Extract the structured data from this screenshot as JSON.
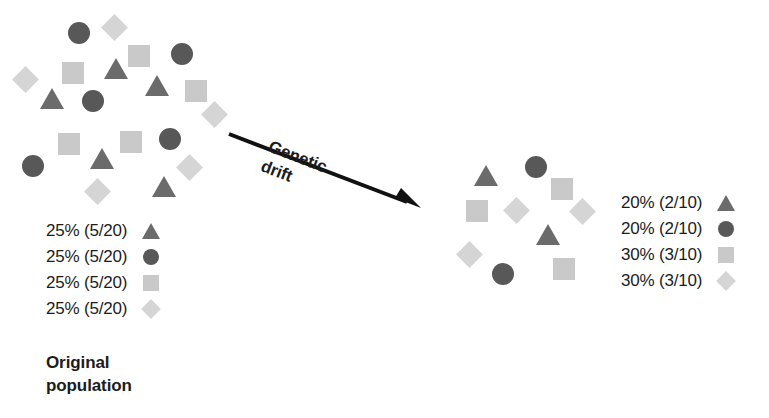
{
  "figure": {
    "type": "genetic-drift-diagram",
    "caption": {
      "line1": "Original",
      "line2": "population"
    },
    "arrow": {
      "label_line1": "Genetic",
      "label_line2": "drift"
    }
  },
  "colors": {
    "triangle": "#6b6b6b",
    "circle": "#585858",
    "square": "#c9c9c9",
    "diamond": "#d5d5d5",
    "text": "#1c1c1c",
    "background": "#ffffff"
  },
  "original_population": {
    "total": 20,
    "legend": [
      {
        "label": "25% (5/20)",
        "marker": "triangle-marker",
        "percent": 25,
        "count": 5,
        "of": 20
      },
      {
        "label": "25% (5/20)",
        "marker": "circle-marker",
        "percent": 25,
        "count": 5,
        "of": 20
      },
      {
        "label": "25% (5/20)",
        "marker": "square-marker",
        "percent": 25,
        "count": 5,
        "of": 20
      },
      {
        "label": "25% (5/20)",
        "marker": "diamond-marker",
        "percent": 25,
        "count": 5,
        "of": 20
      }
    ],
    "shapes": [
      {
        "kind": "circle",
        "x": 68,
        "y": 22
      },
      {
        "kind": "diamond",
        "x": 105,
        "y": 18
      },
      {
        "kind": "square",
        "x": 128,
        "y": 45
      },
      {
        "kind": "circle",
        "x": 171,
        "y": 43
      },
      {
        "kind": "square",
        "x": 62,
        "y": 62
      },
      {
        "kind": "triangle",
        "x": 104,
        "y": 58
      },
      {
        "kind": "triangle",
        "x": 145,
        "y": 75
      },
      {
        "kind": "diamond",
        "x": 16,
        "y": 70
      },
      {
        "kind": "square",
        "x": 185,
        "y": 80
      },
      {
        "kind": "triangle",
        "x": 40,
        "y": 88
      },
      {
        "kind": "circle",
        "x": 82,
        "y": 90
      },
      {
        "kind": "diamond",
        "x": 205,
        "y": 105
      },
      {
        "kind": "square",
        "x": 58,
        "y": 133
      },
      {
        "kind": "square",
        "x": 120,
        "y": 131
      },
      {
        "kind": "circle",
        "x": 159,
        "y": 128
      },
      {
        "kind": "circle",
        "x": 22,
        "y": 155
      },
      {
        "kind": "triangle",
        "x": 90,
        "y": 148
      },
      {
        "kind": "diamond",
        "x": 180,
        "y": 158
      },
      {
        "kind": "diamond",
        "x": 88,
        "y": 182
      },
      {
        "kind": "triangle",
        "x": 152,
        "y": 176
      }
    ]
  },
  "drifted_population": {
    "total": 10,
    "legend": [
      {
        "label": "20% (2/10)",
        "marker": "triangle-marker",
        "percent": 20,
        "count": 2,
        "of": 10
      },
      {
        "label": "20% (2/10)",
        "marker": "circle-marker",
        "percent": 20,
        "count": 2,
        "of": 10
      },
      {
        "label": "30% (3/10)",
        "marker": "square-marker",
        "percent": 30,
        "count": 3,
        "of": 10
      },
      {
        "label": "30% (3/10)",
        "marker": "diamond-marker",
        "percent": 30,
        "count": 3,
        "of": 10
      }
    ],
    "shapes": [
      {
        "kind": "triangle",
        "x": 474,
        "y": 165
      },
      {
        "kind": "circle",
        "x": 525,
        "y": 156
      },
      {
        "kind": "square",
        "x": 551,
        "y": 178
      },
      {
        "kind": "square",
        "x": 466,
        "y": 200
      },
      {
        "kind": "diamond",
        "x": 507,
        "y": 201
      },
      {
        "kind": "diamond",
        "x": 573,
        "y": 202
      },
      {
        "kind": "triangle",
        "x": 536,
        "y": 224
      },
      {
        "kind": "diamond",
        "x": 460,
        "y": 245
      },
      {
        "kind": "circle",
        "x": 492,
        "y": 263
      },
      {
        "kind": "square",
        "x": 553,
        "y": 258
      }
    ]
  }
}
